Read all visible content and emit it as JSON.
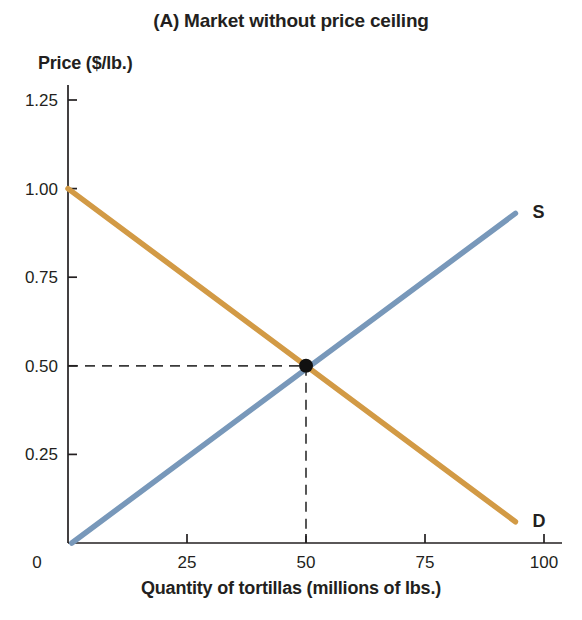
{
  "figure": {
    "background": "#ffffff",
    "text_color": "#231f20"
  },
  "chart_data": {
    "type": "line",
    "title": "(A) Market without price ceiling",
    "ylabel": "Price ($/lb.)",
    "xlabel": "Quantity of tortillas (millions of lbs.)",
    "xlim": [
      0,
      104
    ],
    "ylim": [
      0,
      1.29
    ],
    "grid": false,
    "legend_position": "curve-end-labels",
    "x_ticks": [
      {
        "value": 0,
        "label": "0"
      },
      {
        "value": 25,
        "label": "25"
      },
      {
        "value": 50,
        "label": "50"
      },
      {
        "value": 75,
        "label": "75"
      },
      {
        "value": 100,
        "label": "100"
      }
    ],
    "y_ticks": [
      {
        "value": 0.25,
        "label": "0.25"
      },
      {
        "value": 0.5,
        "label": "0.50"
      },
      {
        "value": 0.75,
        "label": "0.75"
      },
      {
        "value": 1.0,
        "label": "1.00"
      },
      {
        "value": 1.25,
        "label": "1.25"
      }
    ],
    "series": [
      {
        "name": "supply",
        "label": "S",
        "color": "#7898ba",
        "points": [
          [
            0.8,
            0.0
          ],
          [
            94,
            0.93
          ]
        ]
      },
      {
        "name": "demand",
        "label": "D",
        "color": "#d29a45",
        "points": [
          [
            0,
            1.0
          ],
          [
            94,
            0.06
          ]
        ]
      }
    ],
    "equilibrium": {
      "x": 50,
      "y": 0.5
    },
    "dashed_guides": [
      {
        "from": [
          0,
          0.5
        ],
        "to": [
          50,
          0.5
        ]
      },
      {
        "from": [
          50,
          0.5
        ],
        "to": [
          50,
          0
        ]
      }
    ],
    "guide_color": "#3a3a3a",
    "axis_color": "#231f20",
    "point_color": "#111111"
  }
}
